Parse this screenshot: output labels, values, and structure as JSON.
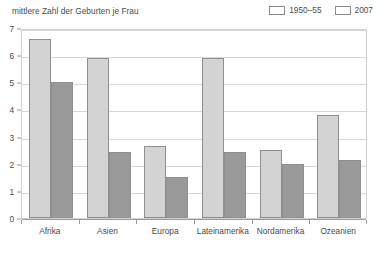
{
  "chart_data": {
    "type": "bar",
    "title": "mittlere Zahl der Geburten je Frau",
    "xlabel": "",
    "ylabel": "",
    "ylim": [
      0,
      7
    ],
    "yticks": [
      "0",
      "1",
      "2",
      "3",
      "4",
      "5",
      "6",
      "7"
    ],
    "grid": true,
    "legend_position": "top-right",
    "categories": [
      "Afrika",
      "Asien",
      "Europa",
      "Lateinamerika",
      "Nordamerika",
      "Ozeanien"
    ],
    "series": [
      {
        "name": "1950–55",
        "color": "#d3d3d3",
        "values": [
          6.6,
          5.9,
          2.65,
          5.9,
          2.5,
          3.8
        ]
      },
      {
        "name": "2007",
        "color": "#9a9a9a",
        "values": [
          5.0,
          2.45,
          1.5,
          2.45,
          2.0,
          2.15
        ]
      }
    ]
  },
  "colors": {
    "series_1950": "#d3d3d3",
    "series_2007": "#9a9a9a",
    "bar_border": "#8f8f8f",
    "gridline": "#d8d8d8",
    "axis": "#9a9a9a",
    "text": "#4a4a4a",
    "frame": "#d0d0d0",
    "background": "#ffffff"
  }
}
